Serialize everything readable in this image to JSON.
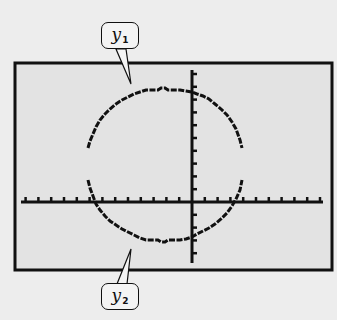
{
  "chart_data": {
    "type": "line",
    "title": "",
    "xlabel": "",
    "ylabel": "",
    "grid": false,
    "legend": "callout labels",
    "series": [
      {
        "name": "y1",
        "description": "upper semicircle",
        "points": [
          [
            -8,
            4.5
          ],
          [
            -7,
            6.3
          ],
          [
            -6,
            7.4
          ],
          [
            -5,
            8.1
          ],
          [
            -4,
            8.6
          ],
          [
            -3,
            9.0
          ],
          [
            -2,
            9.2
          ],
          [
            -1,
            9.2
          ],
          [
            0,
            9.0
          ],
          [
            1,
            8.5
          ],
          [
            2,
            7.8
          ],
          [
            3,
            6.8
          ],
          [
            4,
            4.5
          ]
        ]
      },
      {
        "name": "y2",
        "description": "lower semicircle",
        "points": [
          [
            -8,
            2.0
          ],
          [
            -7,
            -0.5
          ],
          [
            -6,
            -2.0
          ],
          [
            -5,
            -3.0
          ],
          [
            -4,
            -3.6
          ],
          [
            -3,
            -4.0
          ],
          [
            -2,
            -4.2
          ],
          [
            -1,
            -4.2
          ],
          [
            0,
            -4.0
          ],
          [
            1,
            -3.4
          ],
          [
            2,
            -2.4
          ],
          [
            3,
            -1.2
          ],
          [
            4,
            2.0
          ]
        ]
      }
    ],
    "axes": {
      "x_tick_count_left": 13,
      "x_tick_count_right": 10,
      "y_tick_count_up": 10,
      "y_tick_count_down": 5
    },
    "annotations": [
      {
        "text": "y",
        "subscript": "1",
        "points_to": "upper arc"
      },
      {
        "text": "y",
        "subscript": "2",
        "points_to": "lower arc"
      }
    ]
  },
  "labels": {
    "y1": {
      "main": "y",
      "sub": "1"
    },
    "y2": {
      "main": "y",
      "sub": "2"
    }
  },
  "colors": {
    "screen_bg": "#e3e3e3",
    "page_bg": "#ededed",
    "ink": "#111111"
  }
}
